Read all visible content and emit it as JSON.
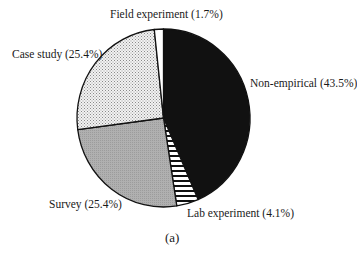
{
  "chart_data": {
    "type": "pie",
    "title": "",
    "caption": "(a)",
    "start_angle_deg": 0,
    "direction": "clockwise",
    "slices": [
      {
        "name": "Non-empirical",
        "value": 43.5,
        "label": "Non-empirical (43.5%)",
        "fill": "solid",
        "color": "#111111"
      },
      {
        "name": "Lab experiment",
        "value": 4.1,
        "label": "Lab experiment (4.1%)",
        "fill": "horizontal-stripes",
        "color": "#ffffff"
      },
      {
        "name": "Survey",
        "value": 25.4,
        "label": "Survey (25.4%)",
        "fill": "gray",
        "color": "#a9a9a9"
      },
      {
        "name": "Case study",
        "value": 25.4,
        "label": "Case study (25.4%)",
        "fill": "dots",
        "color": "#e4e4e4"
      },
      {
        "name": "Field experiment",
        "value": 1.7,
        "label": "Field experiment (1.7%)",
        "fill": "white",
        "color": "#ffffff"
      }
    ],
    "legend": "none (direct labels)"
  },
  "labels": {
    "non_empirical": "Non-empirical (43.5%)",
    "lab_experiment": "Lab experiment (4.1%)",
    "survey": "Survey (25.4%)",
    "case_study": "Case study (25.4%)",
    "field_experiment": "Field experiment (1.7%)"
  },
  "caption": "(a)"
}
